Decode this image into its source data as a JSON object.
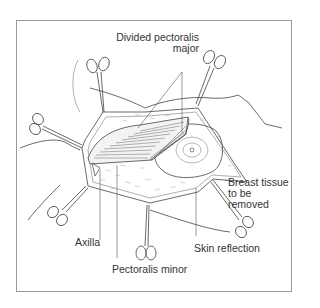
{
  "figure": {
    "labels": {
      "divided_pectoralis_major_line1": "Divided pectoralis",
      "divided_pectoralis_major_line2": "major",
      "breast_tissue_line1": "Breast tissue",
      "breast_tissue_line2": "to be",
      "breast_tissue_line3": "removed",
      "axilla": "Axilla",
      "skin_reflection": "Skin reflection",
      "pectoralis_minor": "Pectoralis minor"
    },
    "instruments": [
      "forceps-top-left",
      "forceps-top-right",
      "forceps-left",
      "forceps-bottom-left",
      "forceps-bottom-center",
      "forceps-bottom-right"
    ],
    "colors": {
      "line": "#444444",
      "frame": "#9a9a9a",
      "text": "#333333"
    }
  }
}
